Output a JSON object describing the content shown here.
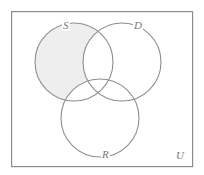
{
  "figure": {
    "type": "venn-diagram",
    "title": "",
    "universe_label": "U",
    "shaded_region_description": "S only",
    "background_color": "#ffffff",
    "stroke_color": "#8e8e92",
    "shade_color": "#eeeeee",
    "label_color": "#77777a",
    "frame": {
      "x": 11,
      "y": 11,
      "width": 182,
      "height": 156,
      "stroke_width": 1.2
    },
    "sets": [
      {
        "id": "S",
        "label": "S",
        "cx": 74,
        "cy": 62,
        "r": 39,
        "shaded": true
      },
      {
        "id": "D",
        "label": "D",
        "cx": 122,
        "cy": 62,
        "r": 39,
        "shaded": false
      },
      {
        "id": "R",
        "label": "R",
        "cx": 100,
        "cy": 118,
        "r": 39,
        "shaded": false
      }
    ],
    "labels": {
      "s": "S",
      "d": "D",
      "r": "R",
      "u": "U"
    }
  }
}
